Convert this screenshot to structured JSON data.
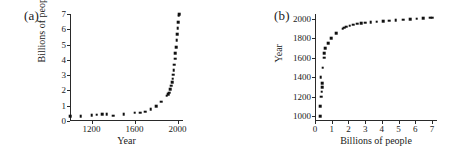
{
  "figure": {
    "panels": [
      {
        "id": "a",
        "label": "(a)",
        "chart_key": 0
      },
      {
        "id": "b",
        "label": "(b)",
        "chart_key": 1
      }
    ]
  },
  "chart_data": [
    {
      "type": "scatter",
      "panel": "(a)",
      "title": "",
      "xlabel": "Year",
      "ylabel": "Billions of people",
      "xlim": [
        1000,
        2050
      ],
      "ylim": [
        0,
        7
      ],
      "xticks": [
        1200,
        1600,
        2000
      ],
      "yticks": [
        0,
        1,
        2,
        3,
        4,
        5,
        6,
        7
      ],
      "xticklabels": [
        "1200",
        "1600",
        "2000"
      ],
      "yticklabels": [
        "0",
        "1",
        "2",
        "3",
        "4",
        "5",
        "6",
        "7"
      ],
      "grid": false,
      "legend": "none",
      "marker": "square",
      "x": [
        1000,
        1100,
        1200,
        1250,
        1300,
        1340,
        1400,
        1500,
        1600,
        1650,
        1700,
        1750,
        1800,
        1850,
        1900,
        1910,
        1920,
        1930,
        1940,
        1950,
        1955,
        1960,
        1965,
        1970,
        1975,
        1980,
        1985,
        1990,
        1995,
        2000,
        2005,
        2010,
        2012
      ],
      "y": [
        0.31,
        0.32,
        0.36,
        0.4,
        0.43,
        0.44,
        0.35,
        0.45,
        0.55,
        0.55,
        0.6,
        0.79,
        0.98,
        1.26,
        1.65,
        1.75,
        1.86,
        2.07,
        2.3,
        2.52,
        2.76,
        3.02,
        3.33,
        3.69,
        4.07,
        4.43,
        4.84,
        5.29,
        5.69,
        6.09,
        6.47,
        6.9,
        7.0
      ]
    },
    {
      "type": "scatter",
      "panel": "(b)",
      "title": "",
      "xlabel": "Billions of people",
      "ylabel": "Year",
      "xlim": [
        0,
        7.3
      ],
      "ylim": [
        950,
        2050
      ],
      "xticks": [
        0,
        1,
        2,
        3,
        4,
        5,
        6,
        7
      ],
      "yticks": [
        1000,
        1200,
        1400,
        1600,
        1800,
        2000
      ],
      "xticklabels": [
        "0",
        "1",
        "2",
        "3",
        "4",
        "5",
        "6",
        "7"
      ],
      "yticklabels": [
        "1000",
        "1200",
        "1400",
        "1600",
        "1800",
        "2000"
      ],
      "grid": false,
      "legend": "none",
      "marker": "square",
      "x": [
        0.31,
        0.32,
        0.36,
        0.4,
        0.43,
        0.44,
        0.35,
        0.45,
        0.55,
        0.55,
        0.6,
        0.79,
        0.98,
        1.26,
        1.65,
        1.75,
        1.86,
        2.07,
        2.3,
        2.52,
        2.76,
        3.02,
        3.33,
        3.69,
        4.07,
        4.43,
        4.84,
        5.29,
        5.69,
        6.09,
        6.47,
        6.9,
        7.0
      ],
      "y": [
        1000,
        1100,
        1200,
        1250,
        1300,
        1340,
        1400,
        1500,
        1600,
        1650,
        1700,
        1750,
        1800,
        1850,
        1900,
        1910,
        1920,
        1930,
        1940,
        1950,
        1955,
        1960,
        1965,
        1970,
        1975,
        1980,
        1985,
        1990,
        1995,
        2000,
        2005,
        2010,
        2012
      ]
    }
  ]
}
